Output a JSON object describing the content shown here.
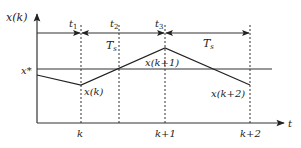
{
  "diagram": {
    "type": "timing-diagram",
    "axes": {
      "y_label": "x(k)",
      "x_label": "t"
    },
    "reference_line_label": "x*",
    "time_markers": [
      {
        "id": "t1",
        "label": "t",
        "sub": "1"
      },
      {
        "id": "t2",
        "label": "t",
        "sub": "2"
      },
      {
        "id": "t3",
        "label": "t",
        "sub": "3"
      }
    ],
    "intervals": [
      {
        "label": "T",
        "sub": "s",
        "from": "t2",
        "region": "t1-t3"
      },
      {
        "label": "T",
        "sub": "s",
        "from": "t3",
        "to": "k+2"
      }
    ],
    "x_ticks": [
      "k",
      "k+1",
      "k+2"
    ],
    "points": [
      {
        "label": "x(k)"
      },
      {
        "label": "x(k+1)"
      },
      {
        "label": "x(k+2)"
      }
    ],
    "colors": {
      "line": "#222222",
      "background": "#ffffff"
    }
  }
}
